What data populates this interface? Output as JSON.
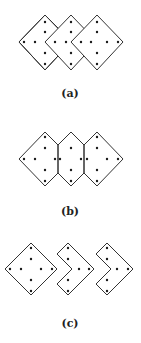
{
  "figure": {
    "panels": [
      {
        "id": "a",
        "label": "(a)",
        "description": "Three overlapping diamonds with dot patterns"
      },
      {
        "id": "b",
        "label": "(b)",
        "description": "Three adjacent hexagonal tiles sharing vertical edges"
      },
      {
        "id": "c",
        "label": "(c)",
        "description": "One diamond followed by two chevron-shaped tiles"
      }
    ]
  }
}
